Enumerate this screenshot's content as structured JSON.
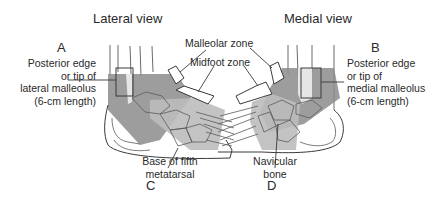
{
  "diagram": {
    "topic": "Ottawa ankle rules zones",
    "views": [
      {
        "id": "lateral",
        "title": "Lateral view"
      },
      {
        "id": "medial",
        "title": "Medial view"
      }
    ],
    "labels": {
      "A": {
        "letter": "A",
        "lines": [
          "Posterior edge",
          "or tip of",
          "lateral malleolus",
          "(6-cm length)"
        ]
      },
      "B": {
        "letter": "B",
        "lines": [
          "Posterior edge",
          "or tip of",
          "medial malleolus",
          "(6-cm length)"
        ]
      },
      "C": {
        "letter": "C",
        "lines": [
          "Base of fifth",
          "metatarsal"
        ]
      },
      "D": {
        "letter": "D",
        "lines": [
          "Navicular",
          "bone"
        ]
      },
      "zones": {
        "malleolar": "Malleolar zone",
        "midfoot": "Midfoot zone"
      }
    },
    "colors": {
      "line": "#3a3a3a",
      "malleolar_zone": "#8c8c8c",
      "midfoot_zone": "#bdbdbd",
      "bone_highlight": "#d9d9d9",
      "background": "#ffffff"
    }
  }
}
